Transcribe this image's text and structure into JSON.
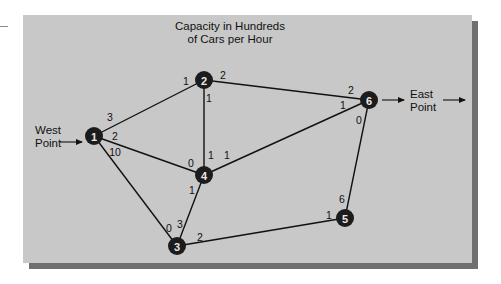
{
  "title": {
    "line1": "Capacity in Hundreds",
    "line2": "of Cars per Hour"
  },
  "source": {
    "line1": "West",
    "line2": "Point"
  },
  "sink": {
    "line1": "East",
    "line2": "Point"
  },
  "colors": {
    "panel": "#c8c8c8",
    "panel_shadow": "#6f6f6f",
    "node": "#1c1c1c",
    "node_text": "#e8e8e8",
    "edge": "#111111"
  },
  "nodes": [
    {
      "id": "1",
      "x": 94,
      "y": 136
    },
    {
      "id": "2",
      "x": 204,
      "y": 80
    },
    {
      "id": "3",
      "x": 177,
      "y": 246
    },
    {
      "id": "4",
      "x": 204,
      "y": 175
    },
    {
      "id": "5",
      "x": 345,
      "y": 218
    },
    {
      "id": "6",
      "x": 369,
      "y": 100
    }
  ],
  "edges": [
    {
      "from": "1",
      "to": "2",
      "cap_from": "3",
      "cap_to": "1"
    },
    {
      "from": "1",
      "to": "4",
      "cap_from": "2",
      "cap_to": "0"
    },
    {
      "from": "1",
      "to": "3",
      "cap_from": "10",
      "cap_to": "0"
    },
    {
      "from": "2",
      "to": "4",
      "cap_from": "1",
      "cap_to": "1"
    },
    {
      "from": "2",
      "to": "6",
      "cap_from": "2",
      "cap_to": "2"
    },
    {
      "from": "4",
      "to": "6",
      "cap_from": "1",
      "cap_to": "1"
    },
    {
      "from": "4",
      "to": "3",
      "cap_from": "1",
      "cap_to": "3"
    },
    {
      "from": "3",
      "to": "5",
      "cap_from": "2",
      "cap_to": "1"
    },
    {
      "from": "6",
      "to": "5",
      "cap_from": "0",
      "cap_to": "6"
    }
  ],
  "capacity_labels": [
    {
      "text": "3",
      "x": 110,
      "y": 117
    },
    {
      "text": "1",
      "x": 186,
      "y": 81
    },
    {
      "text": "2",
      "x": 115,
      "y": 136
    },
    {
      "text": "0",
      "x": 191,
      "y": 163
    },
    {
      "text": "10",
      "x": 115,
      "y": 152
    },
    {
      "text": "0",
      "x": 169,
      "y": 228
    },
    {
      "text": "1",
      "x": 209,
      "y": 98
    },
    {
      "text": "1",
      "x": 211,
      "y": 155
    },
    {
      "text": "2",
      "x": 223,
      "y": 75
    },
    {
      "text": "2",
      "x": 351,
      "y": 90
    },
    {
      "text": "1",
      "x": 227,
      "y": 155
    },
    {
      "text": "1",
      "x": 343,
      "y": 105
    },
    {
      "text": "1",
      "x": 192,
      "y": 190
    },
    {
      "text": "3",
      "x": 180,
      "y": 224
    },
    {
      "text": "2",
      "x": 200,
      "y": 237
    },
    {
      "text": "1",
      "x": 329,
      "y": 215
    },
    {
      "text": "0",
      "x": 359,
      "y": 120
    },
    {
      "text": "6",
      "x": 342,
      "y": 199
    }
  ]
}
